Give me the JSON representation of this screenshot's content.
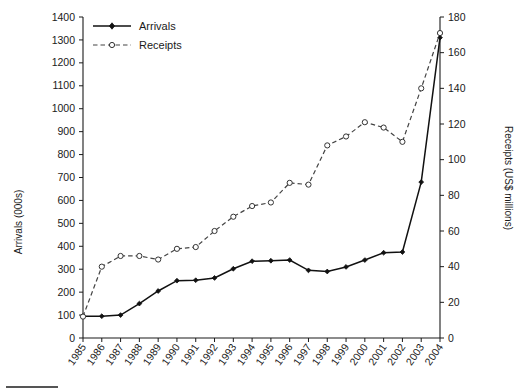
{
  "chart_data": {
    "type": "line",
    "title": "",
    "xlabel": "",
    "categories": [
      "1985",
      "1986",
      "1987",
      "1988",
      "1989",
      "1990",
      "1991",
      "1992",
      "1993",
      "1994",
      "1995",
      "1996",
      "1997",
      "1998",
      "1999",
      "2000",
      "2001",
      "2002",
      "2003",
      "2004"
    ],
    "grid": false,
    "legend_position": "top-left",
    "axes": {
      "left": {
        "label": "Arrivals (000s)",
        "min": 0,
        "max": 1400,
        "step": 100,
        "ticks": [
          0,
          100,
          200,
          300,
          400,
          500,
          600,
          700,
          800,
          900,
          1000,
          1100,
          1200,
          1300,
          1400
        ]
      },
      "right": {
        "label": "Receipts (US$ millions)",
        "min": 0,
        "max": 180,
        "step": 20,
        "ticks": [
          0,
          20,
          40,
          60,
          80,
          100,
          120,
          140,
          160,
          180
        ]
      }
    },
    "series": [
      {
        "name": "Arrivals",
        "axis": "left",
        "units": "000s",
        "marker": "filled-diamond",
        "linestyle": "solid",
        "color": "#111111",
        "values": [
          95,
          95,
          100,
          150,
          205,
          250,
          252,
          262,
          302,
          335,
          337,
          340,
          295,
          290,
          310,
          340,
          372,
          375,
          680,
          1310
        ]
      },
      {
        "name": "Receipts",
        "axis": "right",
        "units": "US$ millions",
        "marker": "open-circle",
        "linestyle": "dashed",
        "color": "#444444",
        "values": [
          12,
          40,
          46,
          46,
          44,
          50,
          51,
          60,
          68,
          74,
          76,
          87,
          86,
          108,
          113,
          121,
          118,
          110,
          140,
          171
        ]
      }
    ]
  },
  "legend": {
    "items": [
      {
        "label": "Arrivals"
      },
      {
        "label": "Receipts"
      }
    ]
  }
}
